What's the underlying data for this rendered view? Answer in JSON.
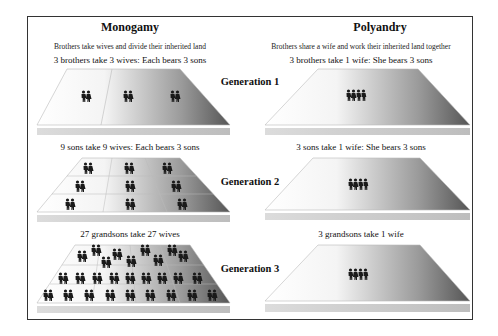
{
  "columns": {
    "left": {
      "title": "Monogamy",
      "subtitle": "Brothers take wives and divide their inherited land"
    },
    "right": {
      "title": "Polyandry",
      "subtitle": "Brothers share a wife and work their inherited land together"
    }
  },
  "generations": [
    {
      "label": "Generation 1",
      "monogamy_caption": "3 brothers take 3 wives: Each bears 3 sons",
      "polyandry_caption": "3 brothers take 1 wife: She bears 3 sons",
      "monogamy_couples": 3,
      "polyandry_people": 4
    },
    {
      "label": "Generation 2",
      "monogamy_caption": "9 sons take 9 wives: Each bears 3 sons",
      "polyandry_caption": "3 sons take 1 wife: She bears 3 sons",
      "monogamy_couples": 9,
      "polyandry_people": 4
    },
    {
      "label": "Generation 3",
      "monogamy_caption": "27 grandsons take 27 wives",
      "polyandry_caption": "3 grandsons take 1 wife",
      "monogamy_couples": 27,
      "polyandry_people": 4
    }
  ],
  "colors": {
    "frame": "#333333",
    "platform_light": "#ffffff",
    "platform_dark": "#5a5a5a",
    "figure": "#1a1a1a"
  }
}
